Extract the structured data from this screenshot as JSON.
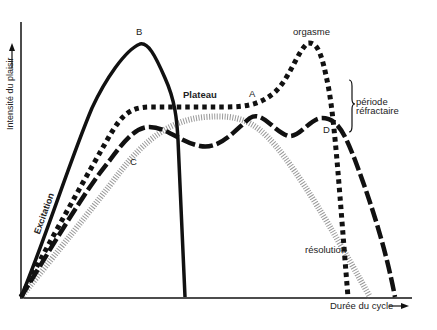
{
  "diagram": {
    "title": "",
    "y_axis_label": "Intensité du plaisir",
    "x_axis_label": "Durée du cycle",
    "labels": {
      "B": "B",
      "A": "A",
      "C": "C",
      "D": "D",
      "plateau": "Plateau",
      "orgasm": "orgasme",
      "refractory_line1": "période",
      "refractory_line2": "réfractaire",
      "resolution": "résolution",
      "excitation": "Excitation"
    },
    "curves": [
      {
        "id": "B",
        "style": "solid-black",
        "description": "rapid rise to high peak B then steep drop"
      },
      {
        "id": "A",
        "style": "dotted-black-squares",
        "description": "rise to plateau, orgasm peak, steep resolution"
      },
      {
        "id": "D",
        "style": "dash-black",
        "description": "rise, undulating plateau, refractory then resolution"
      },
      {
        "id": "C",
        "style": "grey-hatched",
        "description": "gradual rise and gentle fall"
      }
    ],
    "colors": {
      "ink": "#111111",
      "grey": "#9a9a9a",
      "background": "#ffffff"
    }
  }
}
